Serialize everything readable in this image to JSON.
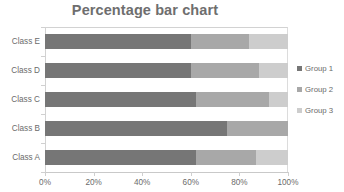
{
  "chart_data": {
    "type": "bar",
    "subtype": "100% stacked horizontal bar",
    "title": "Percentage bar chart",
    "xlabel": "",
    "ylabel": "",
    "orientation": "horizontal",
    "stacked": true,
    "grid": false,
    "legend_position": "right",
    "xlim": [
      0,
      100
    ],
    "xticks": [
      0,
      20,
      40,
      60,
      80,
      100
    ],
    "xtick_labels": [
      "0%",
      "20%",
      "40%",
      "60%",
      "80%",
      "100%"
    ],
    "categories": [
      "Class A",
      "Class B",
      "Class C",
      "Class D",
      "Class E"
    ],
    "categories_top_to_bottom": [
      "Class E",
      "Class D",
      "Class C",
      "Class B",
      "Class A"
    ],
    "series": [
      {
        "name": "Group 1",
        "color": "#767676",
        "values": [
          62,
          75,
          62,
          60,
          60
        ]
      },
      {
        "name": "Group 2",
        "color": "#a8a8a8",
        "values": [
          25,
          25,
          30,
          28,
          24
        ]
      },
      {
        "name": "Group 3",
        "color": "#cdcdcd",
        "values": [
          13,
          0,
          8,
          12,
          16
        ]
      }
    ],
    "rows_top_to_bottom": [
      {
        "category": "Class E",
        "segments": [
          60,
          24,
          16
        ]
      },
      {
        "category": "Class D",
        "segments": [
          60,
          28,
          12
        ]
      },
      {
        "category": "Class C",
        "segments": [
          62,
          30,
          8
        ]
      },
      {
        "category": "Class B",
        "segments": [
          75,
          25,
          0
        ]
      },
      {
        "category": "Class A",
        "segments": [
          62,
          25,
          13
        ]
      }
    ]
  },
  "legend": {
    "items": [
      {
        "label": "Group 1",
        "color": "#767676"
      },
      {
        "label": "Group 2",
        "color": "#a8a8a8"
      },
      {
        "label": "Group 3",
        "color": "#cdcdcd"
      }
    ]
  },
  "colors": {
    "title": "#6e6e6e",
    "axis_text": "#6b6b6b",
    "axis_line": "#d2d2d2",
    "background": "#ffffff"
  }
}
